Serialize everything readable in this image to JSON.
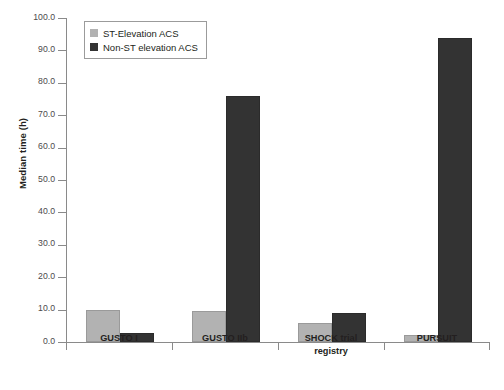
{
  "chart_data": {
    "type": "bar",
    "title": "",
    "xlabel": "",
    "ylabel": "Median time (h)",
    "ylim": [
      0,
      100
    ],
    "yticks": [
      "0.0",
      "10.0",
      "20.0",
      "30.0",
      "40.0",
      "50.0",
      "60.0",
      "70.0",
      "80.0",
      "90.0",
      "100.0"
    ],
    "grid": false,
    "legend_position": "upper left",
    "categories": [
      "GUSTO I",
      "GUSTO IIb",
      "SHOCK trial registry",
      "PURSUIT"
    ],
    "category_lines": [
      [
        "GUSTO I"
      ],
      [
        "GUSTO IIb"
      ],
      [
        "SHOCK trial",
        "registry"
      ],
      [
        "PURSUIT"
      ]
    ],
    "series": [
      {
        "name": "ST-Elevation ACS",
        "color": "#b2b2b2",
        "values": [
          10.0,
          9.6,
          6.0,
          2.2
        ]
      },
      {
        "name": "Non-ST elevation ACS",
        "color": "#333333",
        "values": [
          2.7,
          76.0,
          8.9,
          93.8
        ]
      }
    ]
  },
  "legend": {
    "items": [
      {
        "label": "ST-Elevation ACS",
        "swatch": "light"
      },
      {
        "label": "Non-ST elevation ACS",
        "swatch": "dark"
      }
    ]
  },
  "caption_strip": ""
}
